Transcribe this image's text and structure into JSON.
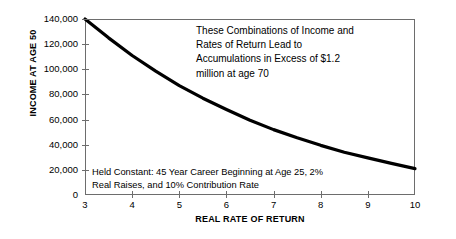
{
  "chart_data": {
    "type": "line",
    "title": "",
    "xlabel": "REAL RATE OF RETURN",
    "ylabel": "INCOME AT AGE 50",
    "xlim": [
      3,
      10
    ],
    "ylim": [
      0,
      140000
    ],
    "grid": false,
    "legend": "none",
    "xticks": [
      "3",
      "4",
      "5",
      "6",
      "7",
      "8",
      "9",
      "10"
    ],
    "xtick_values": [
      3,
      4,
      5,
      6,
      7,
      8,
      9,
      10
    ],
    "yticks": [
      "0",
      "20,000",
      "40,000",
      "60,000",
      "80,000",
      "100,000",
      "120,000",
      "140,000"
    ],
    "ytick_values": [
      0,
      20000,
      40000,
      60000,
      80000,
      100000,
      120000,
      140000
    ],
    "series": [
      {
        "name": "Income at age 50 required for $1.2 million at age 70",
        "x": [
          3,
          3.5,
          4,
          4.5,
          5,
          5.5,
          6,
          6.5,
          7,
          7.5,
          8,
          8.5,
          9,
          9.5,
          10
        ],
        "values": [
          140000,
          125000,
          111000,
          98500,
          87000,
          77000,
          68000,
          59500,
          52000,
          45500,
          39500,
          34000,
          29500,
          25200,
          21000
        ]
      }
    ],
    "annotations": [
      {
        "name": "excess-callout",
        "lines": [
          "These Combinations of Income and",
          "Rates of Return Lead to",
          "Accumulations in Excess of $1.2",
          "million at age 70"
        ]
      },
      {
        "name": "held-constant-note",
        "lines": [
          "Held Constant:  45 Year Career Beginning at Age 25, 2%",
          "Real Raises, and 10% Contribution Rate"
        ]
      }
    ]
  },
  "colors": {
    "curve": "#000000",
    "axis": "#6d6d6d",
    "text": "#000000",
    "background": "#ffffff"
  }
}
